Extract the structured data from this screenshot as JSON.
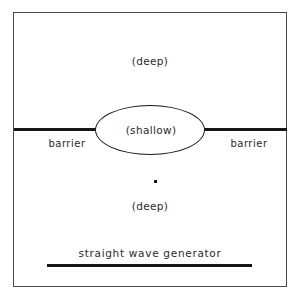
{
  "figure": {
    "background_color": "#ffffff",
    "stroke_color": "#17171a",
    "frame_color": "#4a4a4a",
    "text_color": "#2b2b2e"
  },
  "regions": {
    "deep_top_label": "(deep)",
    "shallow_label": "(shallow)",
    "deep_bottom_label": "(deep)"
  },
  "barriers": {
    "left_label": "barrier",
    "right_label": "barrier"
  },
  "generator": {
    "label": "straight wave generator"
  },
  "markers": {
    "point_name": "observation-point"
  }
}
